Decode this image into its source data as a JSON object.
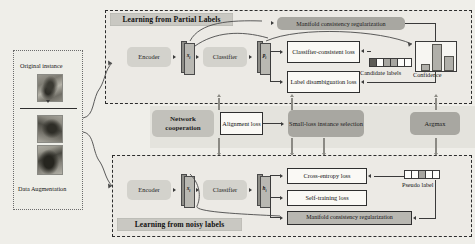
{
  "figure": {
    "type": "architecture-diagram",
    "background_color": "#efeee9"
  },
  "input_panel": {
    "name": "input-instance-panel",
    "top_label": "Original instance",
    "bottom_label": "Data Augmentation",
    "thumbnails": [
      "bird-original",
      "bird-augmented-1",
      "bird-augmented-2"
    ]
  },
  "partial_labels_branch": {
    "title": "Learning from Partial Labels",
    "encoder": "Encoder",
    "feature_symbol": "x",
    "feature_subscript": "i",
    "classifier": "Classifier",
    "prediction_symbol": "p",
    "prediction_subscript": "i",
    "manifold_box": "Manifold consistency regularization",
    "losses": [
      "Classifier-consistent loss",
      "Label disambiguation loss"
    ],
    "candidate_labels_caption": "Candidate labels",
    "candidate_labels_cells": [
      "fill-dark",
      "fill-none",
      "fill-mid",
      "fill-mid",
      "fill-none",
      "fill-none"
    ],
    "confidence_caption": "Confidence",
    "confidence_values": [
      0.12,
      0.95,
      0.45
    ]
  },
  "noisy_labels_branch": {
    "title": "Learning from noisy labels",
    "encoder": "Encoder",
    "feature_symbol": "x",
    "feature_subscript": "i",
    "classifier": "Classifier",
    "prediction_symbol": "h",
    "prediction_subscript": "i",
    "losses": [
      "Cross-entropy loss",
      "Self-training loss",
      "Manifold consistency regularization"
    ],
    "pseudo_label_caption": "Pseudo label",
    "pseudo_label_cells": [
      "fill-none",
      "fill-none",
      "fill-mid",
      "fill-none",
      "fill-none"
    ]
  },
  "cooperation_band": {
    "title": "Network cooperation",
    "alignment_loss": "Alignment loss",
    "small_loss_selection": "Small-loss instance selection",
    "argmax": "Argmax"
  },
  "colors": {
    "module_grey": "#d3d2cc",
    "module_dark_grey": "#a8a7a1",
    "loss_box_bg": "#faf9f5",
    "stroke": "#2f2f2f",
    "arrow_grey": "#8b8a84"
  }
}
